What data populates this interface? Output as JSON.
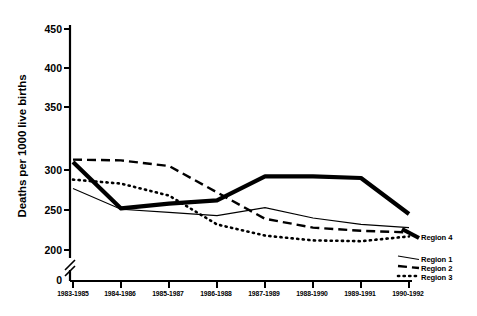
{
  "chart_data": {
    "type": "line",
    "title": "",
    "xlabel": "",
    "ylabel": "Deaths per 1000 live births",
    "categories": [
      "1983-1985",
      "1984-1986",
      "1985-1987",
      "1986-1988",
      "1987-1989",
      "1988-1990",
      "1989-1991",
      "1990-1992"
    ],
    "ylim": [
      200,
      450
    ],
    "yticks": [
      200,
      250,
      300,
      350,
      400,
      450
    ],
    "ytick_labels": [
      "200",
      "250",
      "300",
      "350",
      "400",
      "450"
    ],
    "y_axis_break": true,
    "y_origin_label": "0",
    "grid": false,
    "legend_position": "right-inline",
    "series": [
      {
        "name": "Region 4",
        "style": "solid-thick",
        "color": "#000000",
        "values": [
          310,
          252,
          258,
          262,
          292,
          292,
          290,
          245
        ]
      },
      {
        "name": "Region 1",
        "style": "solid-thin",
        "color": "#000000",
        "values": [
          277,
          251,
          247,
          243,
          253,
          240,
          232,
          228
        ]
      },
      {
        "name": "Region 2",
        "style": "dashed",
        "color": "#000000",
        "values": [
          313,
          312,
          305,
          272,
          239,
          228,
          224,
          222
        ]
      },
      {
        "name": "Region 3",
        "style": "dotted",
        "color": "#000000",
        "values": [
          288,
          283,
          268,
          232,
          218,
          212,
          211,
          217
        ]
      }
    ]
  },
  "legend": {
    "region4": "Region 4",
    "region1": "Region 1",
    "region2": "Region 2",
    "region3": "Region 3"
  }
}
